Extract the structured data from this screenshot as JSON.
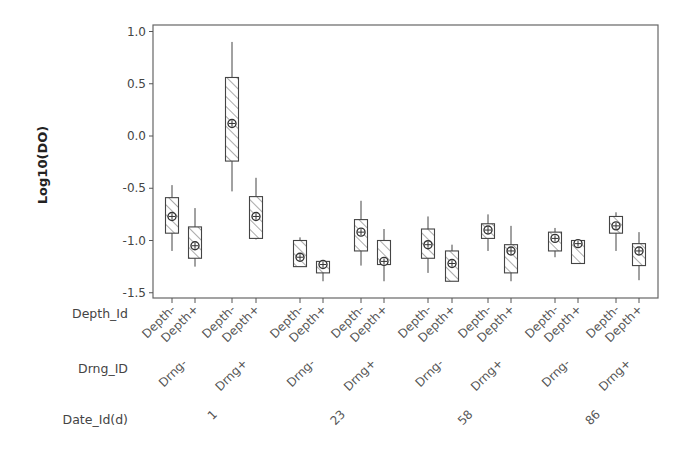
{
  "chart_data": {
    "type": "box",
    "title": "",
    "ylabel": "Log10(DO)",
    "xlabel": "",
    "ylim": [
      -1.55,
      1.07
    ],
    "yticks": [
      1.0,
      0.5,
      0.0,
      -0.5,
      -1.0,
      -1.5
    ],
    "ytick_labels": [
      "1.0",
      "0.5",
      "0.0",
      "-0.5",
      "-1.0",
      "-1.5"
    ],
    "grid": false,
    "legend": null,
    "factor_rows": [
      {
        "name": "Depth_Id",
        "label": "Depth_Id"
      },
      {
        "name": "Drng_ID",
        "label": "Drng_ID"
      },
      {
        "name": "Date_Id",
        "label": "Date_Id(d)"
      }
    ],
    "dates": [
      "1",
      "23",
      "58",
      "86"
    ],
    "drainage_labels": [
      "Drng-",
      "Drng+",
      "Drng-",
      "Drng+",
      "Drng-",
      "Drng+",
      "Drng-",
      "Drng+"
    ],
    "depth_labels": [
      "Depth-",
      "Depth+"
    ],
    "boxes": [
      {
        "date": "1",
        "drng": "Drng-",
        "depth": "Depth-",
        "whisker_low": -1.1,
        "q1": -0.93,
        "median": -0.77,
        "q3": -0.59,
        "whisker_high": -0.47
      },
      {
        "date": "1",
        "drng": "Drng-",
        "depth": "Depth+",
        "whisker_low": -1.25,
        "q1": -1.17,
        "median": -1.05,
        "q3": -0.87,
        "whisker_high": -0.69
      },
      {
        "date": "1",
        "drng": "Drng+",
        "depth": "Depth-",
        "whisker_low": -0.53,
        "q1": -0.24,
        "median": 0.12,
        "q3": 0.56,
        "whisker_high": 0.9
      },
      {
        "date": "1",
        "drng": "Drng+",
        "depth": "Depth+",
        "whisker_low": -0.99,
        "q1": -0.98,
        "median": -0.77,
        "q3": -0.58,
        "whisker_high": -0.4
      },
      {
        "date": "23",
        "drng": "Drng-",
        "depth": "Depth-",
        "whisker_low": -1.25,
        "q1": -1.25,
        "median": -1.16,
        "q3": -1.0,
        "whisker_high": -0.97
      },
      {
        "date": "23",
        "drng": "Drng-",
        "depth": "Depth+",
        "whisker_low": -1.39,
        "q1": -1.31,
        "median": -1.23,
        "q3": -1.2,
        "whisker_high": -1.19
      },
      {
        "date": "23",
        "drng": "Drng+",
        "depth": "Depth-",
        "whisker_low": -1.24,
        "q1": -1.1,
        "median": -0.92,
        "q3": -0.8,
        "whisker_high": -0.62
      },
      {
        "date": "23",
        "drng": "Drng+",
        "depth": "Depth+",
        "whisker_low": -1.39,
        "q1": -1.23,
        "median": -1.2,
        "q3": -1.0,
        "whisker_high": -0.89
      },
      {
        "date": "58",
        "drng": "Drng-",
        "depth": "Depth-",
        "whisker_low": -1.31,
        "q1": -1.17,
        "median": -1.04,
        "q3": -0.89,
        "whisker_high": -0.77
      },
      {
        "date": "58",
        "drng": "Drng-",
        "depth": "Depth+",
        "whisker_low": -1.39,
        "q1": -1.39,
        "median": -1.22,
        "q3": -1.1,
        "whisker_high": -1.04
      },
      {
        "date": "58",
        "drng": "Drng+",
        "depth": "Depth-",
        "whisker_low": -1.1,
        "q1": -0.98,
        "median": -0.9,
        "q3": -0.84,
        "whisker_high": -0.75
      },
      {
        "date": "58",
        "drng": "Drng+",
        "depth": "Depth+",
        "whisker_low": -1.39,
        "q1": -1.31,
        "median": -1.1,
        "q3": -1.04,
        "whisker_high": -0.86
      },
      {
        "date": "86",
        "drng": "Drng-",
        "depth": "Depth-",
        "whisker_low": -1.16,
        "q1": -1.1,
        "median": -0.98,
        "q3": -0.92,
        "whisker_high": -0.88
      },
      {
        "date": "86",
        "drng": "Drng-",
        "depth": "Depth+",
        "whisker_low": -1.22,
        "q1": -1.22,
        "median": -1.03,
        "q3": -1.0,
        "whisker_high": -1.0
      },
      {
        "date": "86",
        "drng": "Drng+",
        "depth": "Depth-",
        "whisker_low": -1.1,
        "q1": -0.93,
        "median": -0.86,
        "q3": -0.77,
        "whisker_high": -0.73
      },
      {
        "date": "86",
        "drng": "Drng+",
        "depth": "Depth+",
        "whisker_low": -1.38,
        "q1": -1.24,
        "median": -1.1,
        "q3": -1.03,
        "whisker_high": -0.92
      }
    ],
    "x_positions": [
      172,
      195,
      232,
      256,
      300,
      323,
      361,
      384,
      428,
      452,
      488,
      511,
      555,
      578,
      616,
      639
    ],
    "style": {
      "box_fill": "hatched",
      "line_color": "#444444",
      "marker": "circle-cross"
    }
  }
}
